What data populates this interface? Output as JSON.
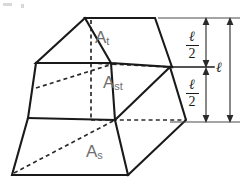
{
  "figure": {
    "type": "prismatoid-solid-diagram",
    "stroke_color": "#1a1a1a",
    "label_color": "#6f6f6f",
    "background": "#ffffff"
  },
  "labels": {
    "top_area": {
      "base": "A",
      "sub": "t"
    },
    "mid_area": {
      "base": "A",
      "sub": "st"
    },
    "base_area": {
      "base": "A",
      "sub": "s"
    }
  },
  "dimensions": {
    "upper_half": {
      "numerator": "ℓ",
      "denominator": "2"
    },
    "lower_half": {
      "numerator": "ℓ",
      "denominator": "2"
    },
    "total": "ℓ"
  },
  "geometry": {
    "top_face": [
      [
        85,
        18
      ],
      [
        155,
        18
      ],
      [
        172,
        68
      ],
      [
        77,
        62
      ]
    ],
    "mid_face": [
      [
        36,
        63
      ],
      [
        118,
        63
      ],
      [
        112,
        118
      ],
      [
        28,
        118
      ]
    ],
    "base_face": [
      [
        12,
        175
      ],
      [
        128,
        175
      ],
      [
        172,
        118
      ],
      [
        36,
        118
      ]
    ],
    "vertices": {
      "top_back_left": [
        85,
        18
      ],
      "top_back_right": [
        155,
        18
      ],
      "top_front_right": [
        172,
        68
      ],
      "top_front_left": [
        77,
        62
      ],
      "mid_left": [
        36,
        63
      ],
      "mid_right": [
        170,
        68
      ],
      "base_left": [
        12,
        175
      ],
      "base_right": [
        128,
        175
      ],
      "base_far_right": [
        186,
        120
      ]
    },
    "extension_lines": {
      "top_y": 18,
      "mid_y": 68,
      "bottom_y": 122
    },
    "dim_lines_x": {
      "inner": 206,
      "outer": 230
    }
  }
}
